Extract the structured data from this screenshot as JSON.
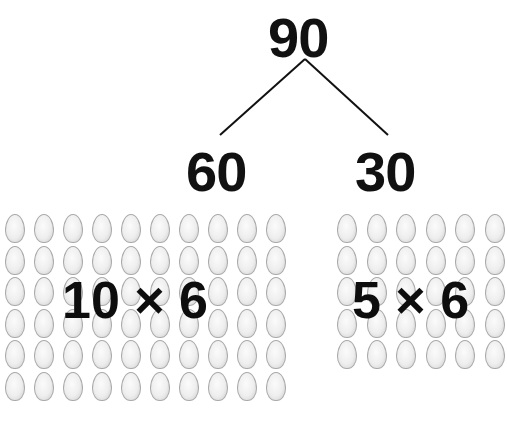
{
  "tree": {
    "root": "90",
    "left_child": "60",
    "right_child": "30"
  },
  "arrays": {
    "left": {
      "rows": 6,
      "cols": 10,
      "label": "10 × 6",
      "item": "egg-icon"
    },
    "right": {
      "rows": 5,
      "cols": 6,
      "label": "5 × 6",
      "item": "egg-icon"
    }
  },
  "colors": {
    "text": "#111111",
    "egg_fill": "#eeeeee",
    "egg_outline": "#a9a9a9",
    "background": "#ffffff"
  }
}
